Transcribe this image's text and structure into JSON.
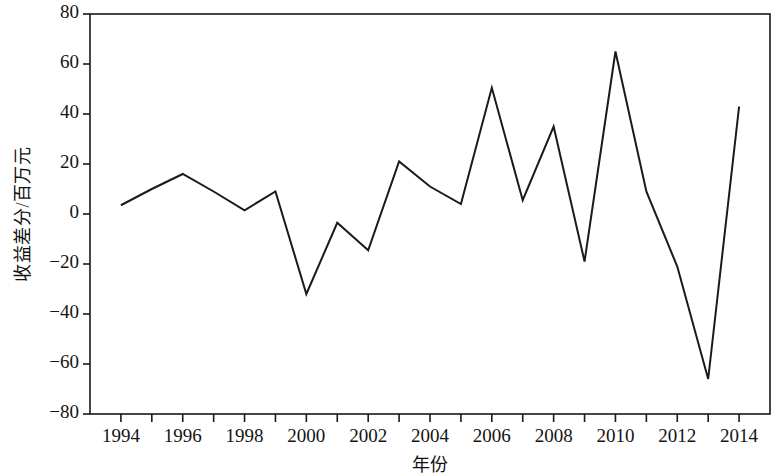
{
  "chart_data": {
    "type": "line",
    "title": "",
    "xlabel": "年份",
    "ylabel": "收益差分/百万元",
    "xlim": [
      1993,
      2015
    ],
    "ylim": [
      -80,
      80
    ],
    "grid": false,
    "legend": null,
    "line_color": "#1a1a1a",
    "background_color": "#ffffff",
    "axis_color": "#1a1a1a",
    "x": [
      1994,
      1995,
      1996,
      1997,
      1998,
      1999,
      2000,
      2001,
      2002,
      2003,
      2004,
      2005,
      2006,
      2007,
      2008,
      2009,
      2010,
      2011,
      2012,
      2013,
      2014
    ],
    "values": [
      3.5,
      10,
      16,
      9,
      1.5,
      9,
      -32,
      -3.5,
      -14.5,
      21,
      11,
      4,
      50.5,
      5.5,
      35,
      -19,
      65,
      9,
      -21,
      -66,
      43
    ],
    "series": [
      {
        "name": "收益差分",
        "values": [
          3.5,
          10,
          16,
          9,
          1.5,
          9,
          -32,
          -3.5,
          -14.5,
          21,
          11,
          4,
          50.5,
          5.5,
          35,
          -19,
          65,
          9,
          -21,
          -66,
          43
        ]
      }
    ],
    "x_tick_values": [
      1994,
      1996,
      1998,
      2000,
      2002,
      2004,
      2006,
      2008,
      2010,
      2012,
      2014
    ],
    "x_tick_labels": [
      "1994",
      "1996",
      "1998",
      "2000",
      "2002",
      "2004",
      "2006",
      "2008",
      "2010",
      "2012",
      "2014"
    ],
    "x_minor_tick_values": [
      1995,
      1997,
      1999,
      2001,
      2003,
      2005,
      2007,
      2009,
      2011,
      2013
    ],
    "y_tick_values": [
      80,
      60,
      40,
      20,
      0,
      -20,
      -40,
      -60,
      -80
    ],
    "y_tick_labels": [
      "80",
      "60",
      "40",
      "20",
      "0",
      "−20",
      "−40",
      "−60",
      "−80"
    ]
  }
}
